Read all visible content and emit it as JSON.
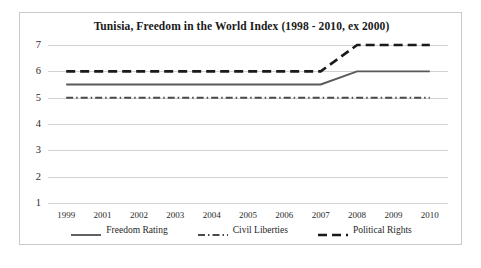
{
  "chart_data": {
    "type": "line",
    "title": "Tunisia, Freedom in the World Index (1998 - 2010, ex 2000)",
    "xlabel": "",
    "ylabel": "",
    "x": [
      "1999",
      "2001",
      "2002",
      "2003",
      "2004",
      "2005",
      "2006",
      "2007",
      "2008",
      "2009",
      "2010"
    ],
    "categories": [
      "1999",
      "2001",
      "2002",
      "2003",
      "2004",
      "2005",
      "2006",
      "2007",
      "2008",
      "2009",
      "2010"
    ],
    "xtick_labels": [
      "1999",
      "2001",
      "2002",
      "2003",
      "2004",
      "2005",
      "2006",
      "2007",
      "2008",
      "2009",
      "2010"
    ],
    "ytick_labels": [
      "1",
      "2",
      "3",
      "4",
      "5",
      "6",
      "7"
    ],
    "ylim": [
      1,
      7
    ],
    "yticks": [
      1,
      2,
      3,
      4,
      5,
      6,
      7
    ],
    "grid": "horizontal",
    "legend_position": "bottom",
    "series": [
      {
        "name": "Freedom Rating",
        "style": "solid",
        "color": "#595959",
        "values": [
          5.5,
          5.5,
          5.5,
          5.5,
          5.5,
          5.5,
          5.5,
          5.5,
          6.0,
          6.0,
          6.0
        ]
      },
      {
        "name": "Civil Liberties",
        "style": "dash-dot",
        "color": "#4a4a4a",
        "values": [
          5.0,
          5.0,
          5.0,
          5.0,
          5.0,
          5.0,
          5.0,
          5.0,
          5.0,
          5.0,
          5.0
        ]
      },
      {
        "name": "Political Rights",
        "style": "dashed",
        "color": "#1a1a1a",
        "values": [
          6.0,
          6.0,
          6.0,
          6.0,
          6.0,
          6.0,
          6.0,
          6.0,
          7.0,
          7.0,
          7.0
        ]
      }
    ]
  },
  "legend": {
    "entries": [
      {
        "label": "Freedom Rating"
      },
      {
        "label": "Civil Liberties"
      },
      {
        "label": "Political Rights"
      }
    ]
  },
  "colors": {
    "frame_border": "#c9c9c9",
    "gridline": "#d2d2d2",
    "text": "#1a1a1a",
    "background": "#ffffff"
  }
}
